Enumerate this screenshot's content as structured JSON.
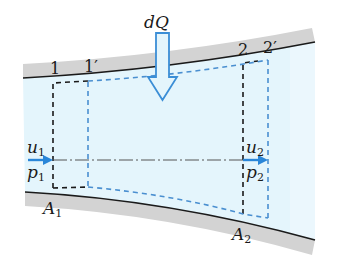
{
  "diagram": {
    "colors": {
      "fluid": "#e4f5fc",
      "wall_band": "#d3d3d3",
      "wall_line": "#1a1a1a",
      "section_1_2_dash": "#1a1a1a",
      "section_primed_dash": "#4a8fd0",
      "flow_arrow": "#2a86d8",
      "heat_arrow_stroke": "#3b8ed6",
      "centerline": "#555555"
    },
    "labels": {
      "heat": {
        "main": "dQ"
      },
      "section1": {
        "main": "1"
      },
      "section1p": {
        "main": "1",
        "prime": "′"
      },
      "section2": {
        "main": "2"
      },
      "section2p": {
        "main": "2",
        "prime": "′"
      },
      "u1": {
        "main": "u",
        "sub": "1"
      },
      "p1": {
        "main": "p",
        "sub": "1"
      },
      "u2": {
        "main": "u",
        "sub": "2"
      },
      "p2": {
        "main": "p",
        "sub": "2"
      },
      "A1": {
        "main": "A",
        "sub": "1"
      },
      "A2": {
        "main": "A",
        "sub": "2"
      }
    }
  }
}
